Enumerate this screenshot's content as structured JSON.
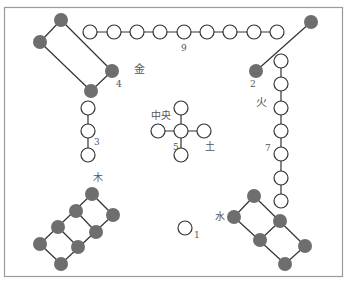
{
  "diagram": {
    "colors": {
      "frame": "#9a9a9a",
      "line": "#333333",
      "dark_node": "#6e6e6e",
      "light_node_fill": "#ffffff",
      "light_node_stroke": "#333333",
      "label": "#555555"
    },
    "labels": {
      "metal": "金",
      "fire": "火",
      "wood": "木",
      "water": "水",
      "earth": "土",
      "center": "中央",
      "n9": "9",
      "n4": "4",
      "n2": "2",
      "n7": "7",
      "n3": "3",
      "n5": "5",
      "n1": "1"
    },
    "groups": [
      {
        "name": "metal-4",
        "count": 4,
        "type": "dark"
      },
      {
        "name": "top-9",
        "count": 9,
        "type": "light"
      },
      {
        "name": "fire-2",
        "count": 2,
        "type": "dark"
      },
      {
        "name": "fire-7",
        "count": 7,
        "type": "light"
      },
      {
        "name": "wood-3",
        "count": 3,
        "type": "light"
      },
      {
        "name": "center-5",
        "count": 5,
        "type": "light"
      },
      {
        "name": "water-1",
        "count": 1,
        "type": "light"
      },
      {
        "name": "wood-8",
        "count": 8,
        "type": "dark"
      },
      {
        "name": "water-6",
        "count": 6,
        "type": "dark"
      }
    ]
  }
}
